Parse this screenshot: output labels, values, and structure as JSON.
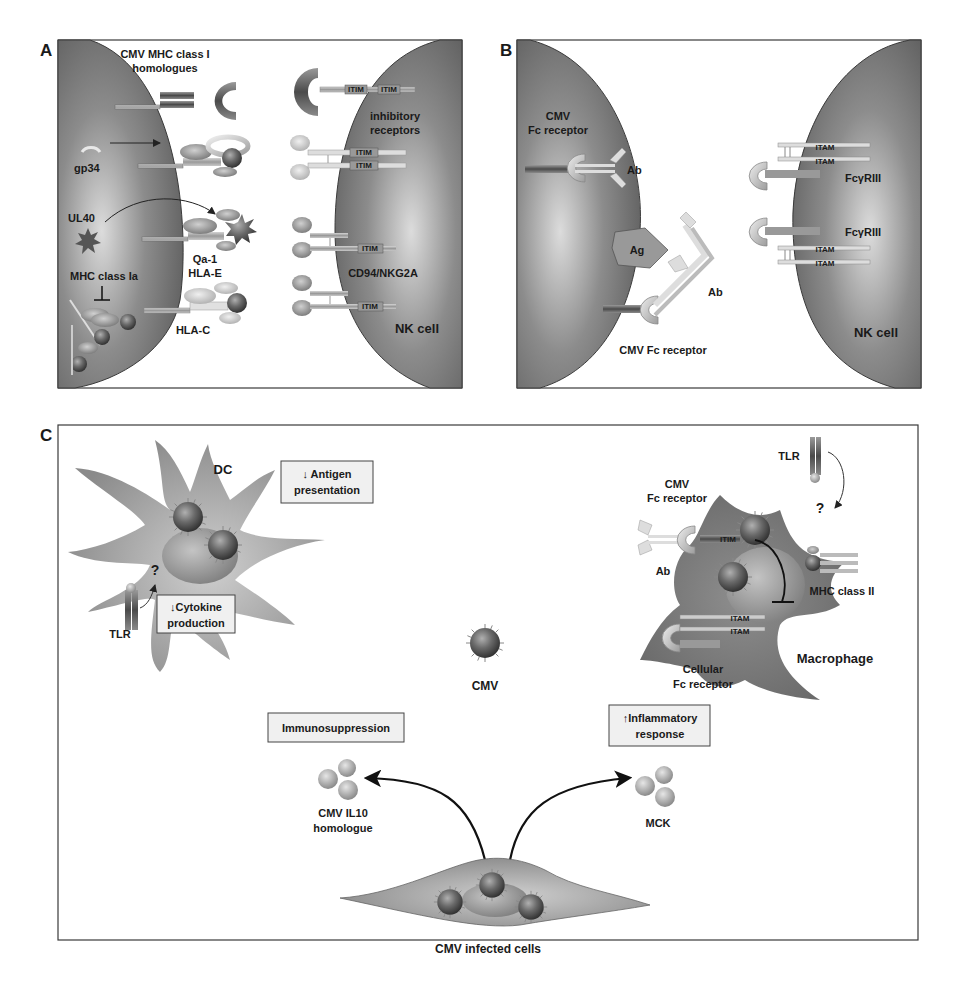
{
  "figure": {
    "panels": {
      "A": {
        "letter": "A",
        "title_line1": "CMV MHC class I",
        "title_line2": "homologues",
        "gp34": "gp34",
        "ul40": "UL40",
        "qa1": "Qa-1",
        "hlae": "HLA-E",
        "mhc_class_ia": "MHC class Ia",
        "hlac": "HLA-C",
        "inhibitory_line1": "inhibitory",
        "inhibitory_line2": "receptors",
        "cd94": "CD94/NKG2A",
        "nk_cell": "NK cell",
        "itim": "ITIM"
      },
      "B": {
        "letter": "B",
        "cmv_fc_line1": "CMV",
        "cmv_fc_line2": "Fc receptor",
        "ab_top": "Ab",
        "ag": "Ag",
        "ab_bottom": "Ab",
        "cmv_fc_bottom": "CMV Fc receptor",
        "fcgriii_1": "FcγRIII",
        "fcgriii_2": "FcγRIII",
        "itam": "ITAM",
        "nk_cell": "NK cell"
      },
      "C": {
        "letter": "C",
        "dc": "DC",
        "antigen_line1": "↓ Antigen",
        "antigen_line2": "presentation",
        "cytokine_line1": "↓Cytokine",
        "cytokine_line2": "production",
        "question": "?",
        "tlr_dc": "TLR",
        "cmv": "CMV",
        "tlr_mac": "TLR",
        "mac_fc_line1": "CMV",
        "mac_fc_line2": "Fc receptor",
        "ab": "Ab",
        "itim": "ITIM",
        "itam": "ITAM",
        "mhc_class_ii": "MHC class II",
        "cellular_fc_line1": "Cellular",
        "cellular_fc_line2": "Fc receptor",
        "macrophage": "Macrophage",
        "immunosuppression": "Immunosuppression",
        "inflammatory_line1": "↑Inflammatory",
        "inflammatory_line2": "response",
        "il10_line1": "CMV  IL10",
        "il10_line2": "homologue",
        "mck": "MCK",
        "infected_cells": "CMV infected cells"
      }
    },
    "colors": {
      "cell_dark": "#6f6f6f",
      "cell_light": "#c8c8c8",
      "receptor_light": "#d8d8d8",
      "virion": "#5a5a5a",
      "border": "#3a3a3a"
    }
  }
}
